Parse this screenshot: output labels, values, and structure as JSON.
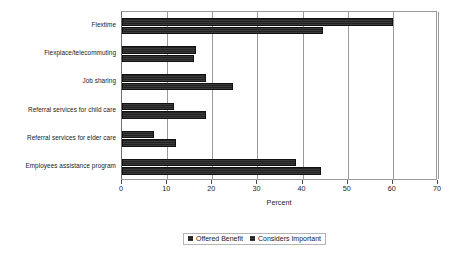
{
  "chart_data": {
    "type": "bar",
    "orientation": "horizontal",
    "title": "",
    "xlabel": "Percent",
    "ylabel": "",
    "xlim": [
      0,
      70
    ],
    "xticks": [
      0,
      10,
      20,
      30,
      40,
      50,
      60,
      70
    ],
    "grid": true,
    "legend_position": "bottom",
    "categories": [
      "Flextime",
      "Flexplace/telecommuting",
      "Job sharing",
      "Referral services for child care",
      "Referral services for elder care",
      "Employees assistance program"
    ],
    "series": [
      {
        "name": "Offered Benefit",
        "color": "#2b2b2b",
        "values": [
          60,
          16.5,
          18.5,
          11.5,
          7,
          38.5
        ]
      },
      {
        "name": "Considers Important",
        "color": "#2b2b2b",
        "values": [
          44.5,
          16,
          24.5,
          18.5,
          12,
          44
        ]
      }
    ]
  },
  "axis": {
    "tick_labels": [
      "0",
      "10",
      "20",
      "30",
      "40",
      "50",
      "60",
      "70"
    ],
    "x_title": "Percent"
  },
  "legend": {
    "items": [
      {
        "label": "Offered Benefit"
      },
      {
        "label": "Considers Important"
      }
    ]
  },
  "labels": {
    "cat0": "Flextime",
    "cat1": "Flexplace/telecommuting",
    "cat2": "Referral services for child care",
    "cat3": "Referral services for elder care",
    "cat4": "Job sharing",
    "cat5": "Employees assistance program"
  }
}
